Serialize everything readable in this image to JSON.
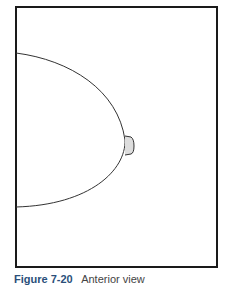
{
  "figure": {
    "type": "line-drawing",
    "frame_color": "#1a1a1a",
    "line_color": "#333333",
    "nipple_fill": "#dddddd"
  },
  "caption": {
    "label": "Figure 7-20",
    "text": "Anterior view"
  }
}
